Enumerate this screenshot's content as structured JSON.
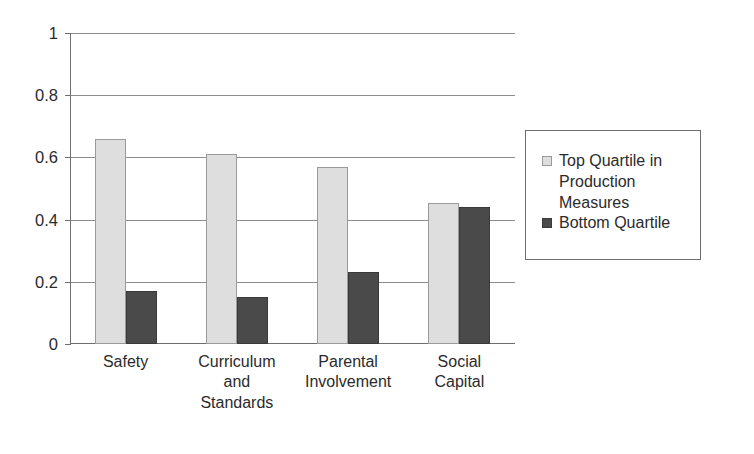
{
  "chart_data": {
    "type": "bar",
    "title": "",
    "xlabel": "",
    "ylabel": "",
    "ylim": [
      0,
      1
    ],
    "yticks": [
      "0",
      "0.2",
      "0.4",
      "0.6",
      "0.8",
      "1"
    ],
    "ytick_values": [
      0,
      0.2,
      0.4,
      0.6,
      0.8,
      1
    ],
    "grid": true,
    "legend_position": "right",
    "categories": [
      "Safety",
      "Curriculum\nand\nStandards",
      "Parental\nInvolvement",
      "Social\nCapital"
    ],
    "categories_plain": [
      "Safety",
      "Curriculum and Standards",
      "Parental Involvement",
      "Social Capital"
    ],
    "series": [
      {
        "name": "Top Quartile in\nProduction Measures",
        "name_plain": "Top Quartile in Production Measures",
        "color": "#dedede",
        "values": [
          0.66,
          0.61,
          0.57,
          0.455
        ]
      },
      {
        "name": "Bottom Quartile",
        "name_plain": "Bottom Quartile",
        "color": "#4a4a4a",
        "values": [
          0.17,
          0.15,
          0.23,
          0.44
        ]
      }
    ]
  },
  "axis": {
    "line_color": "#6e6e6e",
    "grid_color": "#8d8d8d"
  }
}
